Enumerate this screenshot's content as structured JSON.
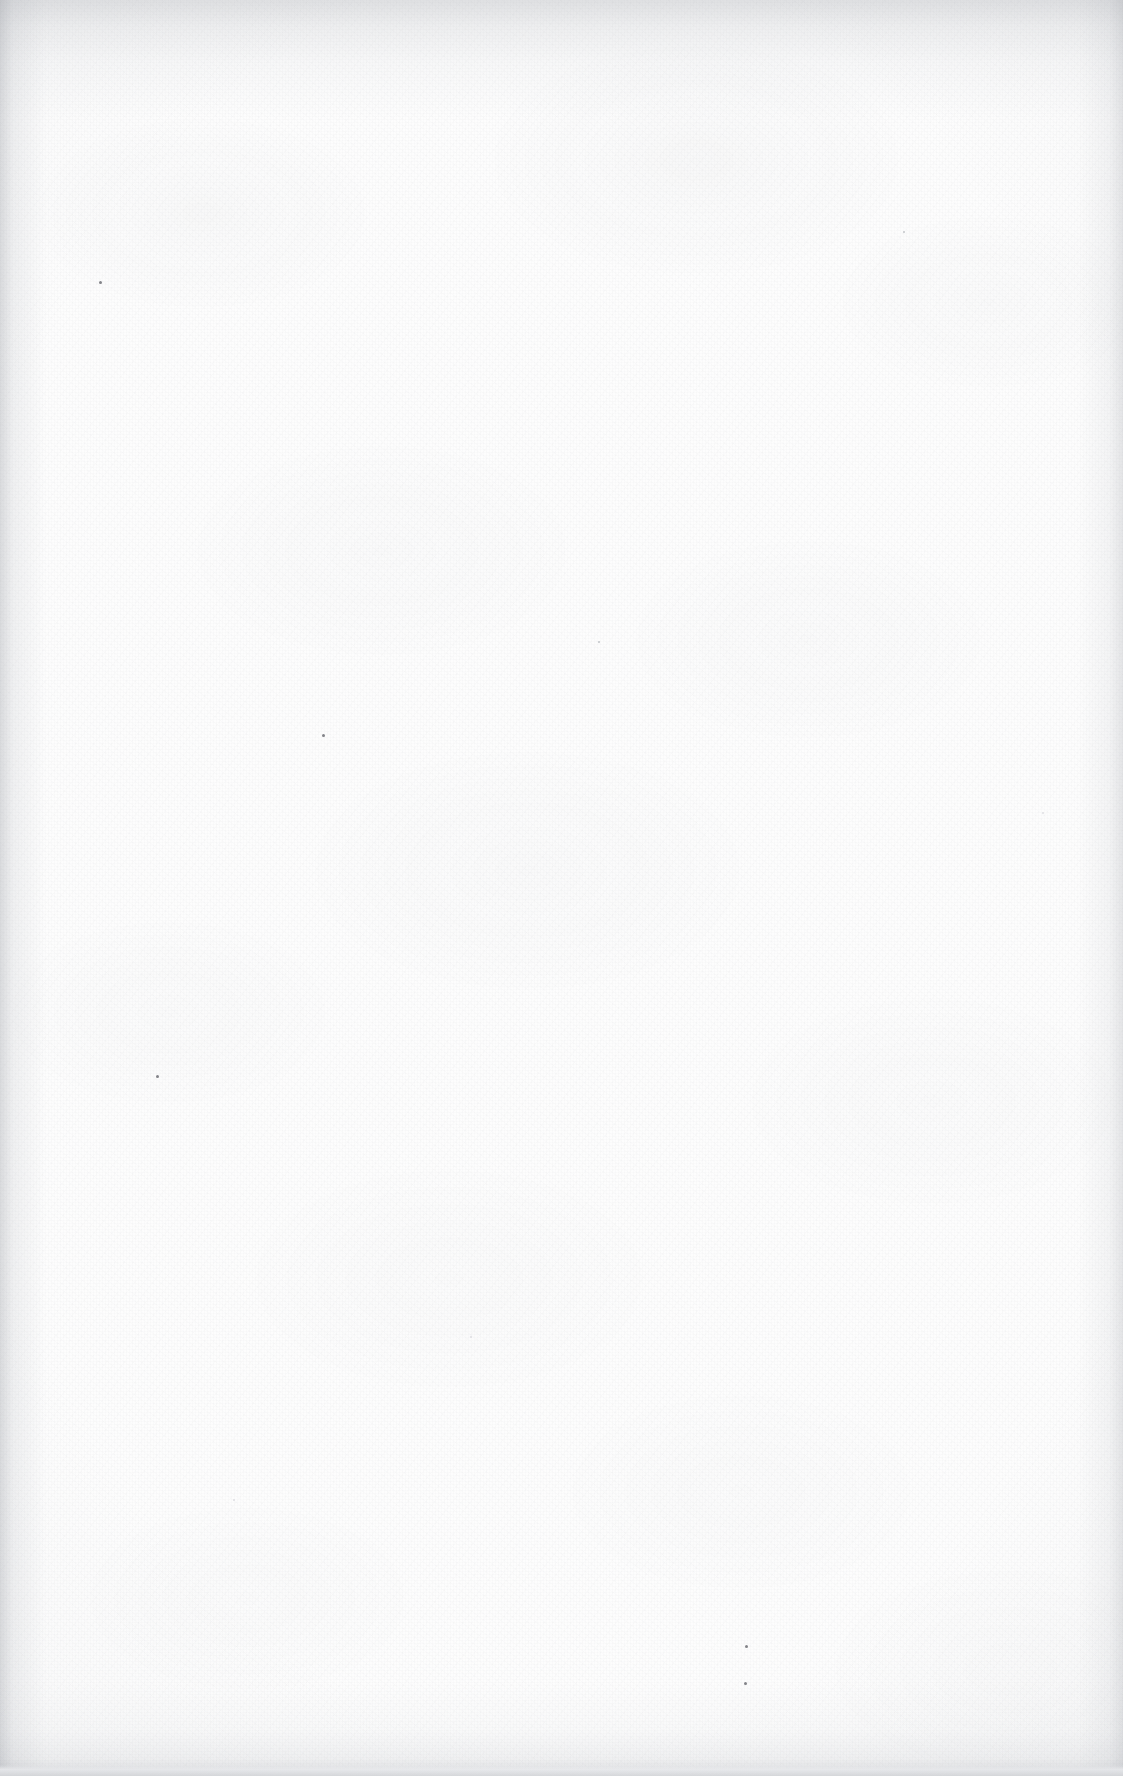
{
  "page": {
    "kind": "scanned-document-page",
    "state": "blank",
    "body_text": "",
    "width_px": 1123,
    "height_px": 1776
  },
  "appearance": {
    "paper_color": "#fdfdfd",
    "grain_color": "#92969e",
    "edge_shadow_color": "#8a8e96",
    "bottom_edge_color": "#d6d8db",
    "speck_color": "#60626 8"
  },
  "marks": {
    "specks": [
      {
        "name": "speck-upper-left",
        "x": 99,
        "y": 281,
        "size": 3,
        "tone": "dark"
      },
      {
        "name": "speck-mid-left",
        "x": 322,
        "y": 734,
        "size": 3,
        "tone": "dark"
      },
      {
        "name": "speck-lower-left",
        "x": 156,
        "y": 1075,
        "size": 3,
        "tone": "dark"
      },
      {
        "name": "speck-lower-center-upper",
        "x": 745,
        "y": 1645,
        "size": 3,
        "tone": "dark"
      },
      {
        "name": "speck-lower-center-lower",
        "x": 744,
        "y": 1682,
        "size": 3,
        "tone": "dark"
      },
      {
        "name": "speck-upper-center",
        "x": 598,
        "y": 641,
        "size": 2,
        "tone": "mid"
      },
      {
        "name": "speck-right-upper",
        "x": 903,
        "y": 231,
        "size": 2,
        "tone": "mid"
      },
      {
        "name": "speck-right-mid",
        "x": 1042,
        "y": 812,
        "size": 2,
        "tone": "light"
      },
      {
        "name": "speck-center-low",
        "x": 470,
        "y": 1336,
        "size": 2,
        "tone": "light"
      },
      {
        "name": "speck-left-low",
        "x": 233,
        "y": 1499,
        "size": 2,
        "tone": "light"
      }
    ]
  }
}
